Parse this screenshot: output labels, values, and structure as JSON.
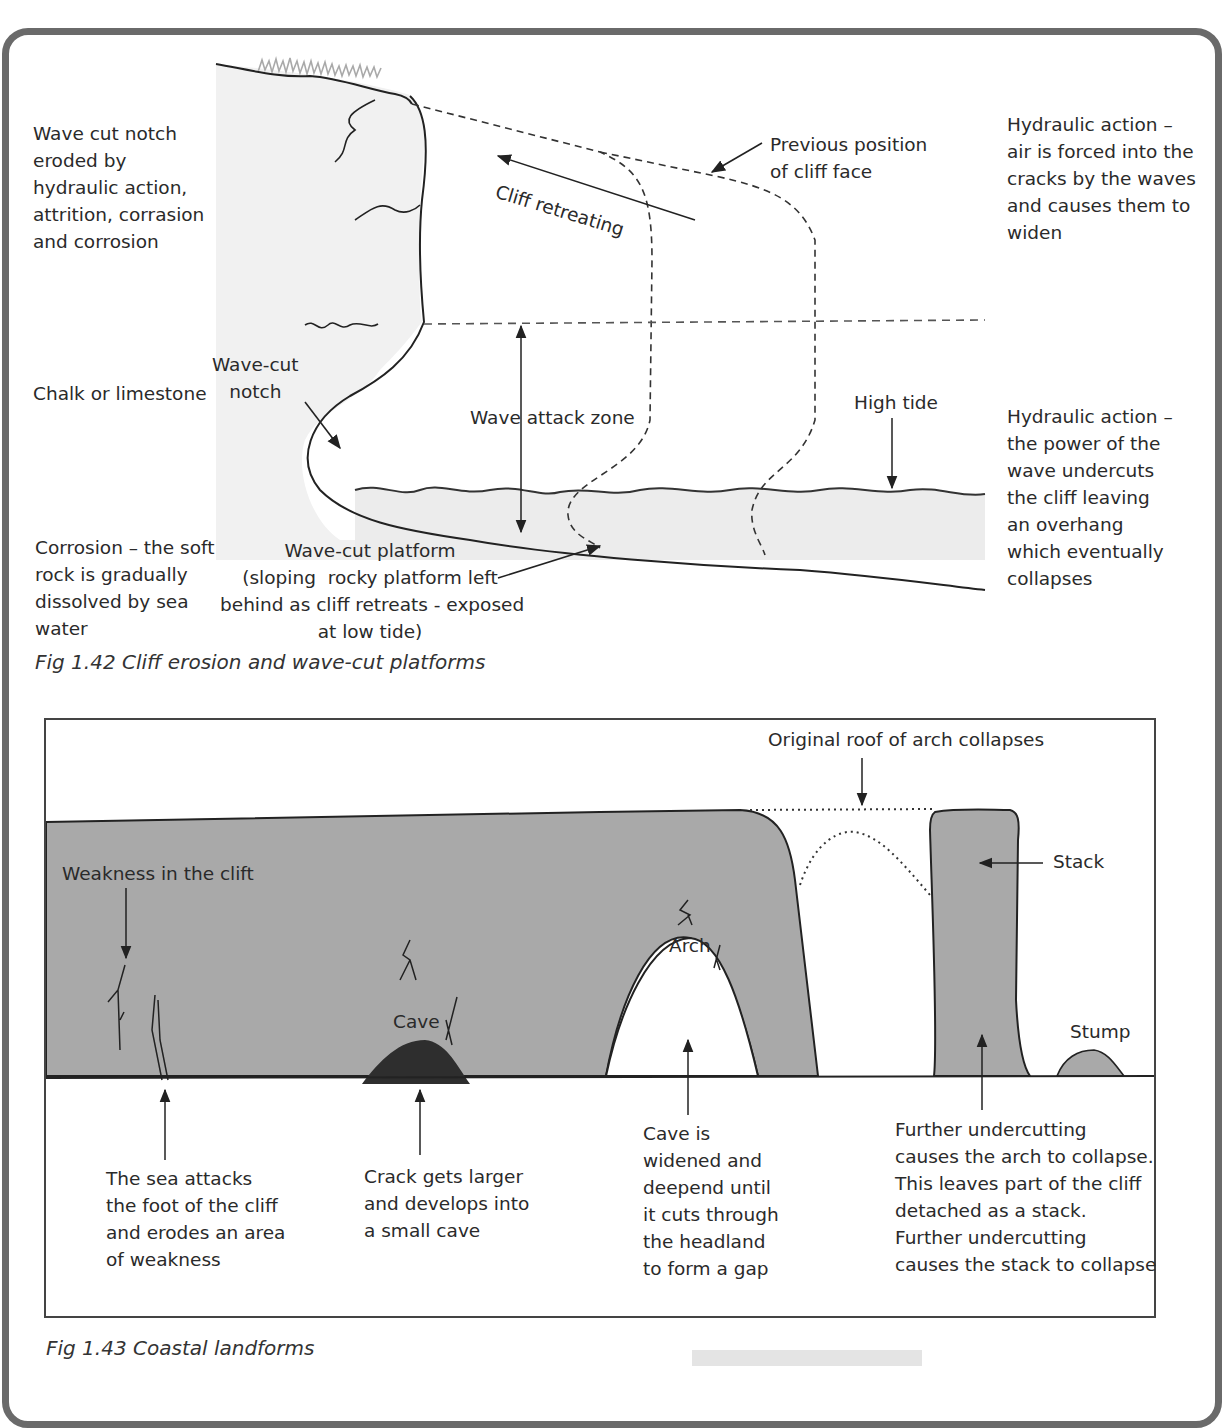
{
  "figure_1_42": {
    "caption": "Fig 1.42 Cliff erosion and wave-cut platforms",
    "labels": {
      "wave_cut_notch_desc": "Wave cut notch\neroded by\nhydraulic action,\nattrition, corrasion\nand corrosion",
      "chalk": "Chalk or limestone",
      "corrosion_desc": "Corrosion – the soft\nrock is gradually\ndissolved by sea\nwater",
      "wave_cut_notch": "Wave-cut\nnotch",
      "cliff_retreating": "Cliff retreating",
      "previous_position": "Previous position\nof cliff face",
      "wave_attack_zone": "Wave attack zone",
      "high_tide": "High tide",
      "wave_cut_platform": "Wave-cut platform\n(sloping  rocky platform left\nbehind as cliff retreats - exposed\nat low tide)",
      "hydraulic_air": "Hydraulic action –\nair is forced into the\ncracks by the waves\nand causes them to\nwiden",
      "hydraulic_power": "Hydraulic action –\nthe power of the\nwave undercuts\nthe cliff leaving\nan overhang\nwhich eventually\ncollapses"
    }
  },
  "figure_1_43": {
    "caption": "Fig 1.43 Coastal landforms",
    "labels": {
      "weakness": "Weakness in the clift",
      "cave": "Cave",
      "arch": "Arch",
      "stack": "Stack",
      "stump": "Stump",
      "original_roof": "Original roof of arch collapses"
    },
    "stages": [
      "The sea attacks\nthe foot of the cliff\nand erodes an area\nof weakness",
      "Crack gets larger\nand develops into\na small cave",
      "Cave is\nwidened and\ndeepend until\nit cuts through\nthe headland\nto form a gap",
      "Further undercutting\ncauses the arch to collapse.\nThis leaves part of the cliff\ndetached as a stack.\nFurther undercutting\ncauses the stack to collapse"
    ]
  },
  "colors": {
    "frame": "#6a6a6a",
    "rock": "#a9a9a9",
    "cave_dark": "#2e2e2e",
    "cliff_light": "#f1f1f1",
    "sea_light": "#ececec"
  }
}
